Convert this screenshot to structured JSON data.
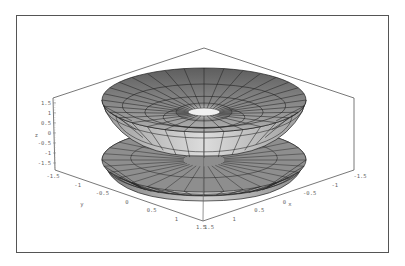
{
  "chart_data": {
    "type": "surface3d",
    "title": "",
    "axes": {
      "x": {
        "label": "x",
        "ticks": [
          "1.5",
          "1",
          "0.5",
          "0",
          "-0.5",
          "-1",
          "-1.5"
        ],
        "range": [
          -1.5,
          1.5
        ]
      },
      "y": {
        "label": "y",
        "ticks": [
          "-1.5",
          "-1",
          "-0.5",
          "0",
          "0.5",
          "1",
          "1.5"
        ],
        "range": [
          -1.5,
          1.5
        ]
      },
      "z": {
        "label": "z",
        "ticks": [
          "1.5",
          "1",
          "0.5",
          "0",
          "-0.5",
          "-1",
          "-1.5"
        ],
        "range": [
          -1.5,
          1.5
        ]
      }
    },
    "box": {
      "top": [
        204,
        48
      ],
      "left_top": [
        53,
        98
      ],
      "right_top": [
        354,
        98
      ],
      "left_bottom": [
        55,
        170
      ],
      "right_bottom": [
        354,
        170
      ],
      "bottom": [
        203,
        221
      ]
    },
    "surface": {
      "upper": {
        "cx": 204,
        "cy": 100,
        "rx": 102,
        "ry": 32,
        "rim_height": 12,
        "hole_rx": 22,
        "hole_ry": 6,
        "hole_cy": 120
      },
      "lower": {
        "cx": 204,
        "cy": 160,
        "rx": 102,
        "ry": 32,
        "dome_bottom": 201
      },
      "meridians": 32,
      "colors": {
        "light": "#d4d4d4",
        "mid": "#a8a8a8",
        "dark": "#6e6e6e",
        "mesh": "#222222"
      }
    },
    "grid": false,
    "legend": null
  }
}
